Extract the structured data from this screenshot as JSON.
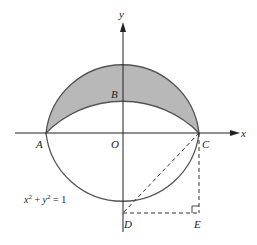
{
  "figure": {
    "axes": {
      "x_label": "x",
      "y_label": "y"
    },
    "points": {
      "A": "A",
      "B": "B",
      "O": "O",
      "C": "C",
      "D": "D",
      "E": "E"
    },
    "equation": {
      "x": "x",
      "sup1": "2",
      "plus": " + ",
      "y": "y",
      "sup2": "2",
      "eq": " = 1"
    },
    "colors": {
      "shade": "#b8b8b8",
      "stroke": "#555555",
      "axis": "#222222"
    }
  }
}
